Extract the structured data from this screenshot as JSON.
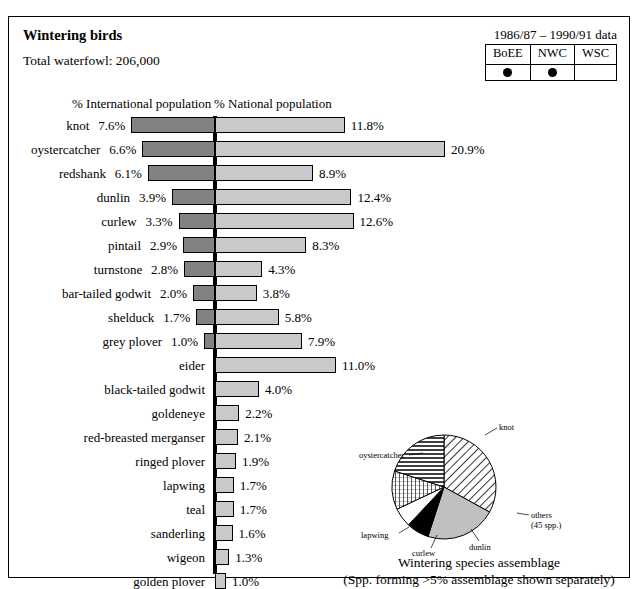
{
  "cut_text": "",
  "panel": {
    "title": "Wintering birds",
    "years": "1986/87 – 1990/91 data",
    "total": "Total waterfowl: 206,000"
  },
  "survey_table": {
    "columns": [
      "BoEE",
      "NWC",
      "WSC"
    ],
    "marks": [
      "●",
      "●",
      ""
    ]
  },
  "headers": {
    "international": "% International population",
    "national": "% National population"
  },
  "chart_data": {
    "type": "bar",
    "title": "Wintering birds",
    "orientation": "horizontal-diverging",
    "xlabel": "",
    "ylabel": "",
    "grid": false,
    "legend_position": "top",
    "series": [
      {
        "name": "% International population",
        "color": "#828282",
        "side": "left"
      },
      {
        "name": "% National population",
        "color": "#c9c9c9",
        "side": "right"
      }
    ],
    "categories": [
      "knot",
      "oystercatcher",
      "redshank",
      "dunlin",
      "curlew",
      "pintail",
      "turnstone",
      "bar-tailed godwit",
      "shelduck",
      "grey plover",
      "eider",
      "black-tailed godwit",
      "goldeneye",
      "red-breasted merganser",
      "ringed plover",
      "lapwing",
      "teal",
      "sanderling",
      "wigeon",
      "golden plover"
    ],
    "international": [
      7.6,
      6.6,
      6.1,
      3.9,
      3.3,
      2.9,
      2.8,
      2.0,
      1.7,
      1.0,
      null,
      null,
      null,
      null,
      null,
      null,
      null,
      null,
      null,
      null
    ],
    "national": [
      11.8,
      20.9,
      8.9,
      12.4,
      12.6,
      8.3,
      4.3,
      3.8,
      5.8,
      7.9,
      11.0,
      4.0,
      2.2,
      2.1,
      1.9,
      1.7,
      1.7,
      1.6,
      1.3,
      1.0
    ],
    "international_labels": [
      "7.6%",
      "6.6%",
      "6.1%",
      "3.9%",
      "3.3%",
      "2.9%",
      "2.8%",
      "2.0%",
      "1.7%",
      "1.0%",
      "",
      "",
      "",
      "",
      "",
      "",
      "",
      "",
      "",
      ""
    ],
    "national_labels": [
      "11.8%",
      "20.9%",
      "8.9%",
      "12.4%",
      "12.6%",
      "8.3%",
      "4.3%",
      "3.8%",
      "5.8%",
      "7.9%",
      "11.0%",
      "4.0%",
      "2.2%",
      "2.1%",
      "1.9%",
      "1.7%",
      "1.7%",
      "1.6%",
      "1.3%",
      "1.0%"
    ],
    "px_per_percent": 11.0
  },
  "pie_chart": {
    "type": "pie",
    "caption_line1": "Wintering species assemblage",
    "caption_line2": "(Spp. forming >5% assemblage shown separately)",
    "slices": [
      {
        "label": "knot",
        "value": 33,
        "fill": "diagonal-hatch"
      },
      {
        "label": "others\n(45 spp.)",
        "label_line1": "others",
        "label_line2": "(45 spp.)",
        "value": 22,
        "fill": "solid-grey"
      },
      {
        "label": "dunlin",
        "value": 7,
        "fill": "solid-black"
      },
      {
        "label": "curlew",
        "value": 6,
        "fill": "white"
      },
      {
        "label": "lapwing",
        "value": 12,
        "fill": "cross-hatch"
      },
      {
        "label": "oystercatcher",
        "value": 20,
        "fill": "horizontal-lines"
      }
    ]
  }
}
